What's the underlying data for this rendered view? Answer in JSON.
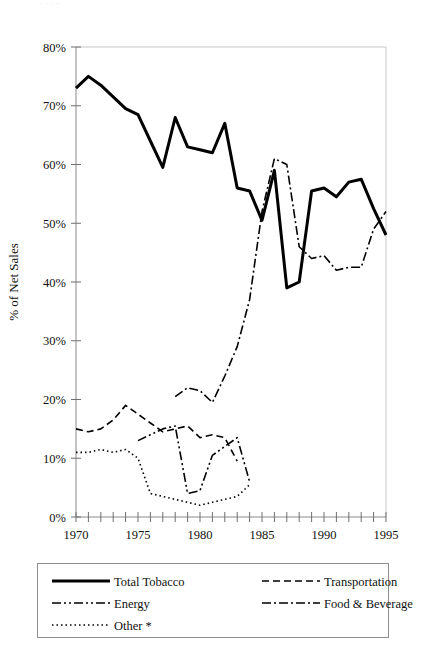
{
  "page": {
    "top_cut_text": "· ·    ·  ··",
    "background": "#ffffff",
    "ink": "#000000"
  },
  "chart_data": {
    "type": "line",
    "title": "",
    "subtitle": "",
    "xlabel": "",
    "ylabel": "% of Net Sales",
    "xlim": [
      1970,
      1995
    ],
    "ylim": [
      0,
      80
    ],
    "grid": false,
    "legend_position": "bottom",
    "x_tick_labels": [
      "1970",
      "1975",
      "1980",
      "1985",
      "1990",
      "1995"
    ],
    "x_tick_values": [
      1970,
      1975,
      1980,
      1985,
      1990,
      1995
    ],
    "x_minor_tick_values": [
      1970,
      1971,
      1972,
      1973,
      1974,
      1975,
      1976,
      1977,
      1978,
      1979,
      1980,
      1981,
      1982,
      1983,
      1984,
      1985,
      1986,
      1987,
      1988,
      1989,
      1990,
      1991,
      1992,
      1993,
      1994,
      1995
    ],
    "y_tick_labels": [
      "0%",
      "10%",
      "20%",
      "30%",
      "40%",
      "50%",
      "60%",
      "70%",
      "80%"
    ],
    "y_tick_values": [
      0,
      10,
      20,
      30,
      40,
      50,
      60,
      70,
      80
    ],
    "series": [
      {
        "name": "Total Tobacco",
        "style": "solid",
        "width": 3,
        "dash": "none",
        "x": [
          1970,
          1971,
          1972,
          1973,
          1974,
          1975,
          1976,
          1977,
          1978,
          1979,
          1980,
          1981,
          1982,
          1983,
          1984,
          1985,
          1986,
          1987,
          1988,
          1989,
          1990,
          1991,
          1992,
          1993,
          1994,
          1995
        ],
        "values": [
          73.0,
          75.0,
          73.5,
          71.5,
          69.5,
          68.5,
          64.0,
          59.5,
          68.0,
          63.0,
          62.5,
          62.0,
          67.0,
          56.0,
          55.5,
          50.5,
          59.0,
          39.0,
          40.0,
          55.5,
          56.0,
          54.5,
          57.0,
          57.5,
          52.5,
          48.0
        ]
      },
      {
        "name": "Transportation",
        "style": "dashed",
        "width": 1.6,
        "dash": "7,4",
        "x": [
          1970,
          1971,
          1972,
          1973,
          1974,
          1975,
          1976,
          1977,
          1978,
          1979,
          1980,
          1981,
          1982,
          1983
        ],
        "values": [
          15.0,
          14.5,
          15.0,
          16.5,
          19.0,
          17.5,
          16.0,
          14.5,
          15.0,
          15.5,
          13.5,
          14.0,
          13.5,
          9.5
        ]
      },
      {
        "name": "Energy",
        "style": "dash-dot-dot",
        "width": 1.6,
        "dash": "9,3,2,3,2,3",
        "x": [
          1975,
          1976,
          1977,
          1978,
          1979,
          1980,
          1981,
          1982,
          1983,
          1984
        ],
        "values": [
          13.0,
          14.0,
          15.0,
          15.5,
          4.0,
          4.5,
          10.5,
          12.0,
          13.5,
          6.0
        ]
      },
      {
        "name": "Food & Beverage",
        "style": "dash-dot",
        "width": 1.6,
        "dash": "9,3,2,3",
        "x": [
          1978,
          1979,
          1980,
          1981,
          1982,
          1983,
          1984,
          1985,
          1986,
          1987,
          1988,
          1989,
          1990,
          1991,
          1992,
          1993,
          1994,
          1995
        ],
        "values": [
          20.5,
          22.0,
          21.5,
          19.5,
          24.0,
          29.0,
          37.0,
          52.0,
          61.0,
          60.0,
          46.0,
          44.0,
          44.5,
          42.0,
          42.5,
          42.5,
          49.0,
          52.0
        ]
      },
      {
        "name": "Other *",
        "style": "dotted",
        "width": 1.6,
        "dash": "1.5,3",
        "x": [
          1970,
          1971,
          1972,
          1973,
          1974,
          1975,
          1976,
          1977,
          1978,
          1979,
          1980,
          1981,
          1982,
          1983,
          1984
        ],
        "values": [
          11.0,
          11.0,
          11.5,
          11.0,
          11.5,
          10.0,
          4.0,
          3.5,
          3.0,
          2.5,
          2.0,
          2.5,
          3.0,
          3.5,
          5.5
        ]
      }
    ]
  },
  "legend": {
    "entries": [
      {
        "label": "Total Tobacco",
        "style": "solid"
      },
      {
        "label": "Transportation",
        "style": "dashed"
      },
      {
        "label": "Energy",
        "style": "dash-dot-dot"
      },
      {
        "label": "Food & Beverage",
        "style": "dash-dot"
      },
      {
        "label": "Other *",
        "style": "dotted"
      }
    ]
  }
}
